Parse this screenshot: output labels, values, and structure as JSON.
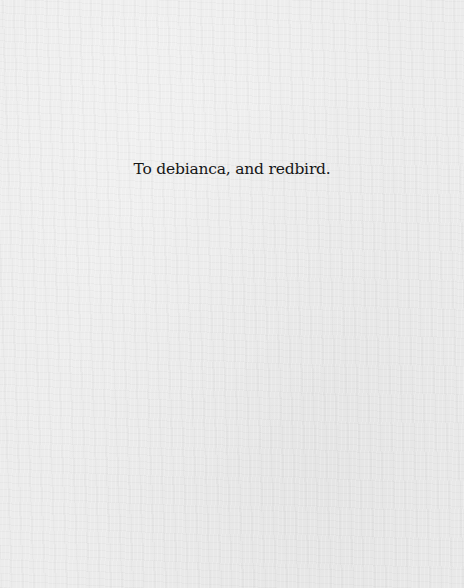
{
  "page": {
    "type": "dedication",
    "text": "To debianca, and redbird."
  },
  "colors": {
    "background": "#ececec",
    "text": "#161616"
  }
}
